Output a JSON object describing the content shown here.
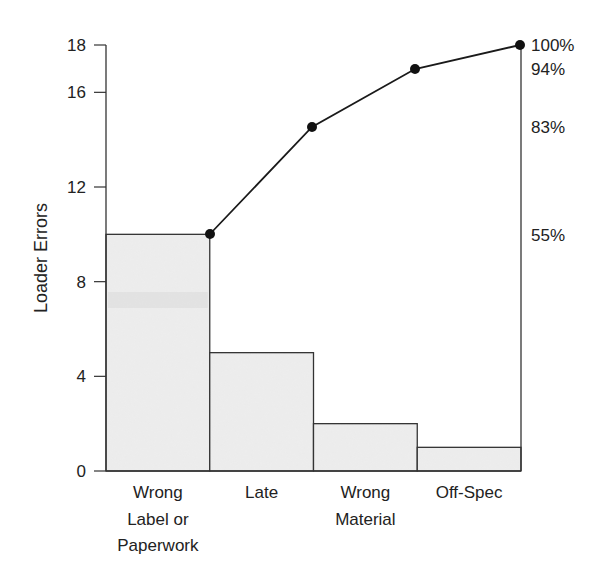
{
  "chart_data": {
    "type": "bar",
    "subtype": "pareto",
    "title": "",
    "xlabel": "",
    "ylabel": "Loader Errors",
    "ylim": [
      0,
      18
    ],
    "yticks": [
      0,
      4,
      8,
      12,
      16,
      18
    ],
    "grid": false,
    "legend": null,
    "categories": [
      "Wrong Label or Paperwork",
      "Late",
      "Wrong Material",
      "Off-Spec"
    ],
    "category_lines": [
      [
        "Wrong",
        "Label or",
        "Paperwork"
      ],
      [
        "Late"
      ],
      [
        "Wrong",
        "Material"
      ],
      [
        "Off-Spec"
      ]
    ],
    "series": [
      {
        "name": "Loader Errors",
        "type": "bar",
        "values": [
          10,
          5,
          2,
          1
        ]
      },
      {
        "name": "Cumulative %",
        "type": "line",
        "values": [
          55,
          83,
          94,
          100
        ],
        "labels": [
          "55%",
          "83%",
          "94%",
          "100%"
        ]
      }
    ],
    "secondary_axis_labels": [
      "100%",
      "94%",
      "83%",
      "55%"
    ],
    "colors": {
      "bar_fill": "#ececec",
      "bar_stroke": "#333333",
      "line": "#1a1a1a",
      "marker": "#111111",
      "axis": "#333333",
      "text": "#222222"
    }
  }
}
